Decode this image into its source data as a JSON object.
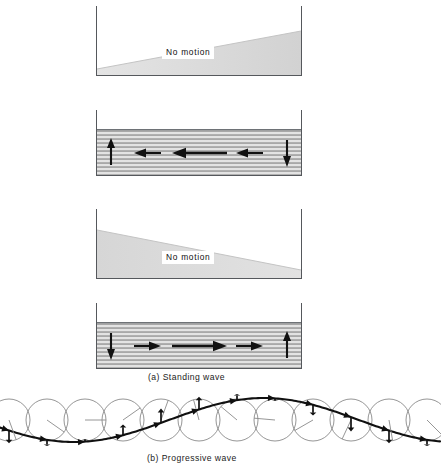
{
  "figure": {
    "title_a": "(a) Standing wave",
    "title_b": "(b) Progressive wave",
    "no_motion_label": "No motion",
    "colors": {
      "frame": "#55585c",
      "wedge_fill": "#d8d8d8",
      "band_hatch_dark": "#8e8e8e",
      "band_hatch_light": "#dedede",
      "arrow": "#111111",
      "wave_curve": "#101010",
      "circle_stroke": "#8a8a8a",
      "radius_line": "#8a8a8a",
      "label_text": "#111111"
    },
    "panels": [
      {
        "id": "panel-1",
        "kind": "displacement-wedge",
        "phase_note": "maximum displacement, no motion",
        "wedge_orientation": "thin-left-thick-right",
        "label": "No motion",
        "x": 96,
        "y": 6,
        "w": 206,
        "h": 70,
        "wedge_left_height": 6,
        "wedge_right_height": 44
      },
      {
        "id": "panel-2",
        "kind": "velocity-band",
        "phase_note": "zero displacement, maximum velocity to the left",
        "band_height": 46,
        "x": 96,
        "y": 110,
        "w": 206,
        "h": 66,
        "arrows": [
          {
            "name": "arrow-up",
            "dir": "up",
            "cx": 15,
            "len": 26
          },
          {
            "name": "arrow-left-short-1",
            "dir": "left",
            "cx": 52,
            "len": 26
          },
          {
            "name": "arrow-left-long",
            "dir": "left",
            "cx": 103,
            "len": 54
          },
          {
            "name": "arrow-left-short-2",
            "dir": "left",
            "cx": 154,
            "len": 26
          },
          {
            "name": "arrow-down",
            "dir": "down",
            "cx": 191,
            "len": 26
          }
        ]
      },
      {
        "id": "panel-3",
        "kind": "displacement-wedge",
        "phase_note": "maximum displacement reversed, no motion",
        "wedge_orientation": "thick-left-thin-right",
        "label": "No motion",
        "x": 96,
        "y": 209,
        "w": 206,
        "h": 70,
        "wedge_left_height": 48,
        "wedge_right_height": 8
      },
      {
        "id": "panel-4",
        "kind": "velocity-band",
        "phase_note": "zero displacement, maximum velocity to the right",
        "band_height": 46,
        "x": 96,
        "y": 303,
        "w": 206,
        "h": 66,
        "arrows": [
          {
            "name": "arrow-down",
            "dir": "down",
            "cx": 15,
            "len": 26
          },
          {
            "name": "arrow-right-short-1",
            "dir": "right",
            "cx": 52,
            "len": 26
          },
          {
            "name": "arrow-right-long",
            "dir": "right",
            "cx": 103,
            "len": 54
          },
          {
            "name": "arrow-right-short-2",
            "dir": "right",
            "cx": 154,
            "len": 26
          },
          {
            "name": "arrow-up",
            "dir": "up",
            "cx": 191,
            "len": 26
          }
        ]
      }
    ],
    "progressive": {
      "baseline_y": 438,
      "circle_radius": 21,
      "circle_count": 12,
      "first_circle_cx": 9,
      "circle_spacing": 38,
      "wave_amplitude": 22,
      "wave_wavelength": 380,
      "wave_phase_deg": 200,
      "particles": [
        {
          "index": 0,
          "phase_deg": 200,
          "marker": "arrow"
        },
        {
          "index": 1,
          "phase_deg": 235,
          "marker": "arrow"
        },
        {
          "index": 2,
          "phase_deg": 270,
          "marker": "arrow"
        },
        {
          "index": 3,
          "phase_deg": 305,
          "marker": "arrow"
        },
        {
          "index": 4,
          "phase_deg": 340,
          "marker": "arrow"
        },
        {
          "index": 5,
          "phase_deg": 15,
          "marker": "arrow"
        },
        {
          "index": 6,
          "phase_deg": 50,
          "marker": "arrow"
        },
        {
          "index": 7,
          "phase_deg": 85,
          "marker": "arrow"
        },
        {
          "index": 8,
          "phase_deg": 120,
          "marker": "arrow"
        },
        {
          "index": 9,
          "phase_deg": 155,
          "marker": "arrow"
        },
        {
          "index": 10,
          "phase_deg": 190,
          "marker": "arrow"
        },
        {
          "index": 11,
          "phase_deg": 225,
          "marker": "arrow"
        }
      ]
    }
  }
}
